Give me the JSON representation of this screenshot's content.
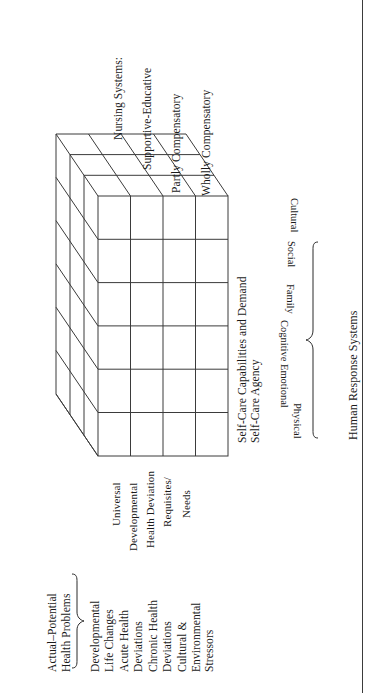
{
  "diagram": {
    "type": "3d-cube-matrix",
    "orientation": "rotated-90-ccw",
    "nursing_systems": {
      "heading": "Nursing Systems:",
      "items": [
        "Supportive-Educative",
        "Partly Compensatory",
        "Wholly Compensatory"
      ]
    },
    "self_care_axis": {
      "line1": "Self-Care Capabilities and Demand",
      "line2": "Self-Care Agency"
    },
    "human_response_systems": {
      "label": "Human Response Systems",
      "items": [
        "Physical",
        "Emotional",
        "Cognitive",
        "Family",
        "Social",
        "Cultural"
      ]
    },
    "self_care_requisites": {
      "items": [
        "Universal",
        "Developmental",
        "Health Deviation",
        "Requisites/",
        "Needs"
      ]
    },
    "actual_potential": {
      "label_line1": "Actual–Potential",
      "label_line2": "Health Problems",
      "items": [
        "Developmental\nLife Changes",
        "Acute Health\nDeviations",
        "Chronic Health\nDeviations",
        "Cultural &\nEnvironmental\nStressors"
      ]
    },
    "grid": {
      "front_columns": 4,
      "front_rows": 6,
      "depth_layers": 3
    },
    "colors": {
      "line": "#3b3b3b",
      "text": "#1a1a1a",
      "background": "#ffffff"
    }
  }
}
